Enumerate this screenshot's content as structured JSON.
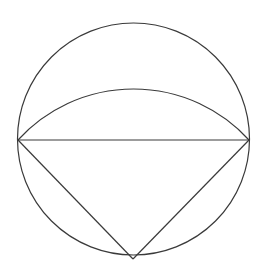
{
  "diagram": {
    "type": "geometry",
    "stroke_color": "#3a3a3a",
    "background": "#ffffff",
    "circle": {
      "cx": 133.5,
      "cy": 139,
      "r": 116
    },
    "points": {
      "left": {
        "x": 18,
        "y": 140
      },
      "right": {
        "x": 249,
        "y": 140
      },
      "bottom": {
        "x": 133,
        "y": 259
      }
    },
    "arc": {
      "from": "left",
      "to": "right",
      "radius": 156.3,
      "apex_y": 89
    },
    "segments": [
      [
        "left",
        "right"
      ],
      [
        "left",
        "bottom"
      ],
      [
        "right",
        "bottom"
      ]
    ]
  }
}
